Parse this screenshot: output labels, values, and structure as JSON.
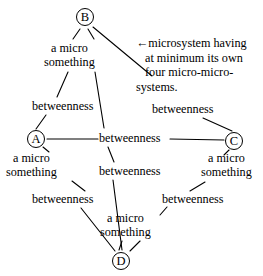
{
  "figure": {
    "type": "node-link-diagram",
    "background_color": "#ffffff",
    "ink_color": "#000000"
  },
  "nodes": [
    {
      "id": "B",
      "label": "B",
      "x": 76,
      "y": 8,
      "name": "node-b"
    },
    {
      "id": "A",
      "label": "A",
      "x": 27,
      "y": 130,
      "name": "node-a"
    },
    {
      "id": "C",
      "label": "C",
      "x": 225,
      "y": 132,
      "name": "node-c"
    },
    {
      "id": "D",
      "label": "D",
      "x": 112,
      "y": 252,
      "name": "node-d"
    }
  ],
  "micro_labels": [
    {
      "id": "micro-top",
      "line1": "a micro",
      "line2": "something",
      "x": 44,
      "y": 41
    },
    {
      "id": "micro-left",
      "line1": "a micro",
      "line2": "something",
      "x": 6,
      "y": 151
    },
    {
      "id": "micro-right",
      "line1": "a micro",
      "line2": "something",
      "x": 201,
      "y": 151
    },
    {
      "id": "micro-bottom",
      "line1": "a micro",
      "line2": "something",
      "x": 100,
      "y": 211
    }
  ],
  "betweenness_labels": [
    {
      "id": "betweenness-upper-left",
      "text": "betweenness",
      "x": 32,
      "y": 99
    },
    {
      "id": "betweenness-upper-right",
      "text": "betweenness",
      "x": 152,
      "y": 102
    },
    {
      "id": "betweenness-center",
      "text": "betweenness",
      "x": 99,
      "y": 131
    },
    {
      "id": "betweenness-lower-mid",
      "text": "betweenness",
      "x": 99,
      "y": 164
    },
    {
      "id": "betweenness-lower-left",
      "text": "betweenness",
      "x": 32,
      "y": 192
    },
    {
      "id": "betweenness-lower-right",
      "text": "betweenness",
      "x": 162,
      "y": 192
    }
  ],
  "annotation": {
    "arrow_glyph": "←",
    "line1": "microsystem having",
    "line2": "at minimum its own",
    "line3": "four  micro-micro-",
    "line4": "systems."
  }
}
